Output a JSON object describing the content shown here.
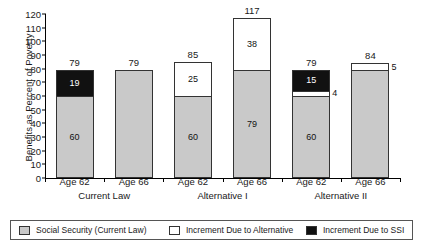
{
  "chart_data": {
    "type": "bar",
    "subtype": "stacked-bar",
    "title": "",
    "xlabel": "",
    "ylabel": "Benefits as Percent of Poverty",
    "ylim": [
      0,
      120
    ],
    "yticks": [
      0,
      10,
      20,
      30,
      40,
      50,
      60,
      70,
      80,
      90,
      100,
      110,
      120
    ],
    "grid": false,
    "legend_position": "bottom",
    "categories": [
      "Age 62",
      "Age 66",
      "Age 62",
      "Age 66",
      "Age 62",
      "Age 66"
    ],
    "groups": [
      {
        "label": "Current Law",
        "categories": [
          "Age 62",
          "Age 66"
        ]
      },
      {
        "label": "Alternative I",
        "categories": [
          "Age 62",
          "Age 66"
        ]
      },
      {
        "label": "Alternative II",
        "categories": [
          "Age 62",
          "Age 66"
        ]
      }
    ],
    "series": [
      {
        "name": "Social Security (Current Law)",
        "color": "#c9c9c9",
        "values": [
          60,
          79,
          60,
          79,
          60,
          79
        ]
      },
      {
        "name": "Increment Due to Alternative",
        "color": "#ffffff",
        "values": [
          0,
          0,
          25,
          38,
          4,
          5
        ]
      },
      {
        "name": "Increment Due to SSI",
        "color": "#111111",
        "values": [
          19,
          0,
          0,
          0,
          15,
          0
        ]
      }
    ],
    "totals": [
      79,
      79,
      85,
      117,
      79,
      84
    ],
    "bars": [
      {
        "group": "Current Law",
        "age": "Age 62",
        "total": "79",
        "segments": [
          {
            "series": "Social Security (Current Law)",
            "value": 60,
            "label": "60",
            "style": "ss"
          },
          {
            "series": "Increment Due to SSI",
            "value": 19,
            "label": "19",
            "style": "ssi"
          }
        ]
      },
      {
        "group": "Current Law",
        "age": "Age 66",
        "total": "79",
        "segments": [
          {
            "series": "Social Security (Current Law)",
            "value": 79,
            "label": "",
            "style": "ss"
          }
        ]
      },
      {
        "group": "Alternative I",
        "age": "Age 62",
        "total": "85",
        "segments": [
          {
            "series": "Social Security (Current Law)",
            "value": 60,
            "label": "60",
            "style": "ss"
          },
          {
            "series": "Increment Due to Alternative",
            "value": 25,
            "label": "25",
            "style": "alt"
          }
        ]
      },
      {
        "group": "Alternative I",
        "age": "Age 66",
        "total": "117",
        "segments": [
          {
            "series": "Social Security (Current Law)",
            "value": 79,
            "label": "79",
            "style": "ss"
          },
          {
            "series": "Increment Due to Alternative",
            "value": 38,
            "label": "38",
            "style": "alt"
          }
        ]
      },
      {
        "group": "Alternative II",
        "age": "Age 62",
        "total": "79",
        "segments": [
          {
            "series": "Social Security (Current Law)",
            "value": 60,
            "label": "60",
            "style": "ss"
          },
          {
            "series": "Increment Due to Alternative",
            "value": 4,
            "label": "4",
            "style": "alt",
            "outside": true
          },
          {
            "series": "Increment Due to SSI",
            "value": 15,
            "label": "15",
            "style": "ssi"
          }
        ]
      },
      {
        "group": "Alternative II",
        "age": "Age 66",
        "total": "84",
        "segments": [
          {
            "series": "Social Security (Current Law)",
            "value": 79,
            "label": "",
            "style": "ss"
          },
          {
            "series": "Increment Due to Alternative",
            "value": 5,
            "label": "5",
            "style": "alt",
            "outside": true
          }
        ]
      }
    ],
    "legend": [
      {
        "label": "Social Security (Current Law)",
        "style": "ss",
        "color": "#c9c9c9"
      },
      {
        "label": "Increment Due to Alternative",
        "style": "alt",
        "color": "#ffffff"
      },
      {
        "label": "Increment Due to SSI",
        "style": "ssi",
        "color": "#111111"
      }
    ]
  }
}
